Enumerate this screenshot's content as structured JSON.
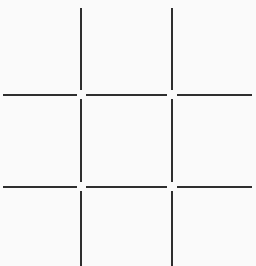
{
  "game": {
    "type": "tic-tac-toe",
    "line_color": "#2e2e2e",
    "background": "#fafafa",
    "cells": [
      {
        "row": 0,
        "col": 0,
        "mark": ""
      },
      {
        "row": 0,
        "col": 1,
        "mark": ""
      },
      {
        "row": 0,
        "col": 2,
        "mark": ""
      },
      {
        "row": 1,
        "col": 0,
        "mark": ""
      },
      {
        "row": 1,
        "col": 1,
        "mark": ""
      },
      {
        "row": 1,
        "col": 2,
        "mark": ""
      },
      {
        "row": 2,
        "col": 0,
        "mark": ""
      },
      {
        "row": 2,
        "col": 1,
        "mark": ""
      },
      {
        "row": 2,
        "col": 2,
        "mark": ""
      }
    ]
  }
}
